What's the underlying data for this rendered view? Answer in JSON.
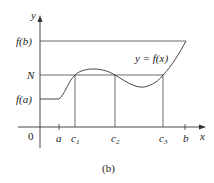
{
  "figure": {
    "caption": "(b)",
    "axes": {
      "x_label": "x",
      "y_label": "y",
      "origin_label": "0"
    },
    "y_ticks": {
      "fb": "f(b)",
      "N": "N",
      "fa": "f(a)"
    },
    "x_ticks": {
      "a": "a",
      "c1": "c",
      "c1_sub": "1",
      "c2": "c",
      "c2_sub": "2",
      "c3": "c",
      "c3_sub": "3",
      "b": "b"
    },
    "curve_label": "y = f(x)",
    "colors": {
      "line": "#333333"
    }
  }
}
